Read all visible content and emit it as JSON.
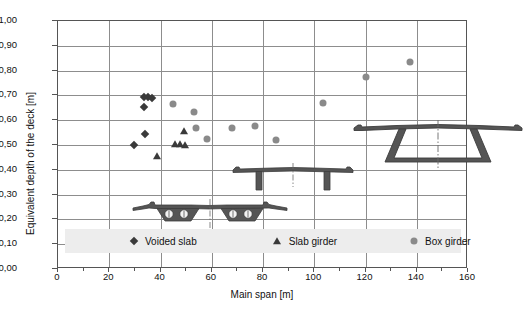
{
  "chart": {
    "type": "scatter",
    "title": "",
    "xlabel": "Main span [m]",
    "ylabel": "Equivalent depth of the deck [m]"
  },
  "axes": {
    "x": {
      "label": "Main span [m]",
      "min": 0,
      "max": 160,
      "tick_step": 20,
      "ticks": [
        "0",
        "20",
        "40",
        "60",
        "80",
        "100",
        "120",
        "140",
        "160"
      ],
      "minor_tick_step": 10,
      "grid": true
    },
    "y": {
      "label": "Equivalent depth of the deck [m]",
      "min": 0.0,
      "max": 1.0,
      "tick_step": 0.1,
      "ticks": [
        "1,00",
        "0,90",
        "0,80",
        "0,70",
        "0,60",
        "0,50",
        "0,40",
        "0,30",
        "0,20",
        "0,10",
        "0,00"
      ],
      "grid": true
    }
  },
  "legend": {
    "position": "inside-bottom",
    "background": "#ededed",
    "entries": [
      {
        "label": "Voided slab",
        "marker": "diamond",
        "color": "#3a3a3a"
      },
      {
        "label": "Slab girder",
        "marker": "triangle",
        "color": "#3a3a3a"
      },
      {
        "label": "Box girder",
        "marker": "circle",
        "color": "#8a8a8a"
      }
    ]
  },
  "chart_data": {
    "type": "scatter",
    "title": "",
    "xlabel": "Main span [m]",
    "ylabel": "Equivalent depth of the deck [m]",
    "xlim": [
      0,
      160
    ],
    "ylim": [
      0.0,
      1.0
    ],
    "xticks": [
      0,
      20,
      40,
      60,
      80,
      100,
      120,
      140,
      160
    ],
    "yticks": [
      0.0,
      0.1,
      0.2,
      0.3,
      0.4,
      0.5,
      0.6,
      0.7,
      0.8,
      0.9,
      1.0
    ],
    "grid": true,
    "legend_position": "inside-bottom",
    "series": [
      {
        "name": "Voided slab",
        "marker": "diamond",
        "color": "#3a3a3a",
        "points": [
          {
            "x": 29.5,
            "y": 0.5
          },
          {
            "x": 34.0,
            "y": 0.545
          },
          {
            "x": 33.5,
            "y": 0.655
          },
          {
            "x": 33.5,
            "y": 0.695
          },
          {
            "x": 35.0,
            "y": 0.695
          },
          {
            "x": 36.5,
            "y": 0.69
          }
        ]
      },
      {
        "name": "Slab girder",
        "marker": "triangle",
        "color": "#3a3a3a",
        "points": [
          {
            "x": 38.5,
            "y": 0.455
          },
          {
            "x": 45.5,
            "y": 0.505
          },
          {
            "x": 47.5,
            "y": 0.505
          },
          {
            "x": 49.5,
            "y": 0.5
          },
          {
            "x": 49.0,
            "y": 0.555
          }
        ]
      },
      {
        "name": "Box girder",
        "marker": "circle",
        "color": "#8a8a8a",
        "points": [
          {
            "x": 45.0,
            "y": 0.665
          },
          {
            "x": 53.0,
            "y": 0.635
          },
          {
            "x": 54.0,
            "y": 0.57
          },
          {
            "x": 58.0,
            "y": 0.525
          },
          {
            "x": 68.0,
            "y": 0.57
          },
          {
            "x": 77.0,
            "y": 0.575
          },
          {
            "x": 85.0,
            "y": 0.52
          },
          {
            "x": 103.5,
            "y": 0.67
          },
          {
            "x": 120.0,
            "y": 0.775
          },
          {
            "x": 137.5,
            "y": 0.835
          }
        ]
      }
    ]
  },
  "cross_sections": [
    {
      "name": "voided-slab-cross-section",
      "caption": ""
    },
    {
      "name": "slab-girder-cross-section",
      "caption": ""
    },
    {
      "name": "box-girder-cross-section",
      "caption": ""
    }
  ]
}
